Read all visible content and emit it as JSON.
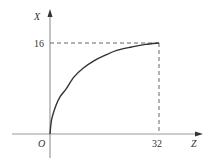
{
  "chart_data": {
    "type": "line",
    "title": "",
    "xlabel": "Z",
    "ylabel": "X",
    "origin_label": "O",
    "x_ticks": [
      "32"
    ],
    "y_ticks": [
      "16"
    ],
    "xlim": [
      0,
      40
    ],
    "ylim": [
      0,
      19
    ],
    "grid": false,
    "legend": null,
    "series": [
      {
        "name": "curve",
        "x": [
          0,
          0.5,
          1.8,
          2.9,
          4.7,
          7,
          9.8,
          13,
          16,
          19.6,
          24,
          28,
          32
        ],
        "y": [
          0,
          2.6,
          5.1,
          6.5,
          7.9,
          10.0,
          11.6,
          12.9,
          13.8,
          14.7,
          15.3,
          15.75,
          16
        ]
      }
    ],
    "annotations": [
      {
        "type": "dashed-line",
        "from": [
          0,
          16
        ],
        "to": [
          32,
          16
        ]
      },
      {
        "type": "dashed-line",
        "from": [
          32,
          16
        ],
        "to": [
          32,
          0
        ]
      }
    ]
  },
  "colors": {
    "axis": "#9a9a9a",
    "curve": "#333333",
    "dashed": "#666666",
    "text": "#333333"
  }
}
